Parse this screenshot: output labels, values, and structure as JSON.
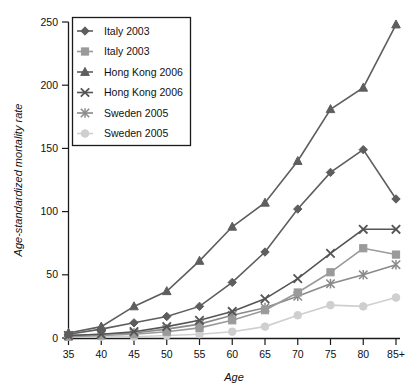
{
  "chart_data": {
    "type": "line",
    "title": "",
    "xlabel": "Age",
    "ylabel": "Age-standardized mortality rate",
    "categories": [
      "35",
      "40",
      "45",
      "50",
      "55",
      "60",
      "65",
      "70",
      "75",
      "80",
      "85+"
    ],
    "xlim": [
      0,
      10
    ],
    "ylim": [
      0,
      250
    ],
    "yticks": [
      0,
      50,
      100,
      150,
      200,
      250
    ],
    "grid": false,
    "legend_position": "top-left",
    "series": [
      {
        "name": "Italy 2003",
        "marker": "diamond",
        "color": "#5e5e5e",
        "values": [
          3,
          7,
          12,
          17,
          25,
          44,
          68,
          102,
          131,
          149,
          110
        ]
      },
      {
        "name": "Italy 2003",
        "marker": "square",
        "color": "#9a9a9a",
        "values": [
          1,
          2,
          3,
          5,
          8,
          14,
          22,
          36,
          52,
          71,
          66
        ]
      },
      {
        "name": "Hong Kong 2006",
        "marker": "triangle",
        "color": "#5e5e5e",
        "values": [
          4,
          9,
          25,
          37,
          61,
          88,
          107,
          140,
          181,
          198,
          248
        ]
      },
      {
        "name": "Hong Kong 2006",
        "marker": "x",
        "color": "#555555",
        "values": [
          2,
          3,
          5,
          9,
          14,
          21,
          31,
          47,
          67,
          86,
          86
        ]
      },
      {
        "name": "Sweden 2005",
        "marker": "asterisk",
        "color": "#8a8a8a",
        "values": [
          2,
          3,
          4,
          7,
          11,
          18,
          24,
          33,
          43,
          50,
          58
        ]
      },
      {
        "name": "Sweden 2005",
        "marker": "circle",
        "color": "#cfcfcf",
        "values": [
          1,
          1,
          1,
          2,
          3,
          5,
          9,
          18,
          26,
          25,
          32
        ]
      }
    ]
  },
  "legend": {
    "items": [
      {
        "label": "Italy 2003"
      },
      {
        "label": "Italy 2003"
      },
      {
        "label": "Hong Kong 2006"
      },
      {
        "label": "Hong Kong 2006"
      },
      {
        "label": "Sweden 2005"
      },
      {
        "label": "Sweden 2005"
      }
    ]
  }
}
